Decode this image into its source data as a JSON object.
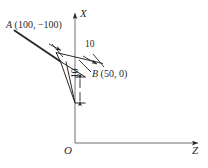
{
  "figure": {
    "type": "engineering-coordinate-diagram",
    "background_color": "#ffffff",
    "line_color": "#29292b",
    "axes": {
      "vertical": {
        "name": "X",
        "label": "X",
        "direction": "up",
        "origin_px": [
          75,
          143
        ],
        "tip_px": [
          75,
          10
        ],
        "has_arrow": true
      },
      "horizontal": {
        "name": "Z",
        "label": "Z",
        "direction": "right",
        "origin_px": [
          75,
          143
        ],
        "tip_px": [
          201,
          143
        ],
        "has_arrow": true
      },
      "origin": {
        "name": "O",
        "label": "O",
        "position_px": [
          75,
          143
        ]
      }
    },
    "points": [
      {
        "id": "A",
        "name": "A",
        "label": "A (100, −100)",
        "coords": [
          100,
          -100
        ],
        "coord_text": "(100, −100)"
      },
      {
        "id": "B",
        "name": "B",
        "label": "B (50, 0)",
        "coords": [
          50,
          0
        ],
        "coord_text": "(50, 0)"
      }
    ],
    "dimensions": [
      {
        "id": "top-width",
        "value": "10",
        "orientation": "horizontal",
        "description": "offset between the two parallel slanted tool-path lines"
      },
      {
        "id": "side-height",
        "value": "10",
        "orientation": "vertical",
        "description": "vertical offset measured down the X axis"
      }
    ]
  }
}
